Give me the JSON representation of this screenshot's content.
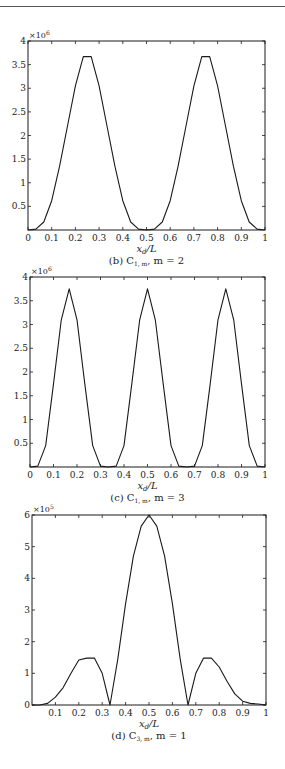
{
  "page": {
    "header_text": "· ·· ·",
    "background": "#ffffff",
    "line_color": "#1a1a1a"
  },
  "chart_data": [
    {
      "id": "b",
      "type": "line",
      "title": "",
      "caption": "(b) C",
      "caption_sub": "1, m",
      "caption_tail": ", m = 2",
      "xlabel": "x_d/L",
      "xlabel_main": "x",
      "xlabel_sub": "d",
      "xlabel_tail": "/L",
      "ylabel": "",
      "y_multiplier": "×10",
      "y_multiplier_exp": "6",
      "xlim": [
        0,
        1
      ],
      "ylim": [
        0,
        4
      ],
      "xticks": [
        0,
        0.1,
        0.2,
        0.3,
        0.4,
        0.5,
        0.6,
        0.7,
        0.8,
        0.9,
        1
      ],
      "xtick_labels": [
        "0",
        "0.1",
        "0.2",
        "0.3",
        "0.4",
        "0.5",
        "0.6",
        "0.7",
        "0.8",
        "0.9",
        "1"
      ],
      "yticks": [
        0.5,
        1,
        1.5,
        2,
        2.5,
        3,
        3.5,
        4
      ],
      "ytick_labels": [
        "0.5",
        "1",
        "1.5",
        "2",
        "2.5",
        "3",
        "3.5",
        "4"
      ],
      "grid": false,
      "legend": null,
      "frame": {
        "top": 41,
        "bottom": 230,
        "left": 28,
        "right": 265
      },
      "x": [
        0,
        0.0333,
        0.0667,
        0.1,
        0.1333,
        0.1667,
        0.2,
        0.2333,
        0.2667,
        0.3,
        0.3333,
        0.3667,
        0.4,
        0.4333,
        0.4667,
        0.5,
        0.5333,
        0.5667,
        0.6,
        0.6333,
        0.6667,
        0.7,
        0.7333,
        0.7667,
        0.8,
        0.8333,
        0.8667,
        0.9,
        0.9333,
        0.9667,
        1
      ],
      "values": [
        0,
        0.02,
        0.17,
        0.62,
        1.35,
        2.2,
        3.05,
        3.67,
        3.67,
        3.05,
        2.2,
        1.35,
        0.62,
        0.17,
        0.02,
        0,
        0.02,
        0.17,
        0.62,
        1.35,
        2.2,
        3.05,
        3.67,
        3.67,
        3.05,
        2.2,
        1.35,
        0.62,
        0.17,
        0.02,
        0
      ]
    },
    {
      "id": "c",
      "type": "line",
      "title": "",
      "caption": "(c) C",
      "caption_sub": "1, m",
      "caption_tail": ", m = 3",
      "xlabel": "x_d/L",
      "xlabel_main": "x",
      "xlabel_sub": "d",
      "xlabel_tail": "/L",
      "ylabel": "",
      "y_multiplier": "×10",
      "y_multiplier_exp": "6",
      "xlim": [
        0,
        1
      ],
      "ylim": [
        0,
        4
      ],
      "xticks": [
        0,
        0.1,
        0.2,
        0.3,
        0.4,
        0.5,
        0.6,
        0.7,
        0.8,
        0.9,
        1
      ],
      "xtick_labels": [
        "0",
        "0.1",
        "0.2",
        "0.3",
        "0.4",
        "0.5",
        "0.6",
        "0.7",
        "0.8",
        "0.9",
        "1"
      ],
      "yticks": [
        0.5,
        1,
        1.5,
        2,
        2.5,
        3,
        3.5,
        4
      ],
      "ytick_labels": [
        "0.5",
        "1",
        "1.5",
        "2",
        "2.5",
        "3",
        "3.5",
        "4"
      ],
      "grid": false,
      "legend": null,
      "frame": {
        "top": 277,
        "bottom": 467,
        "left": 30,
        "right": 265
      },
      "x": [
        0,
        0.0333,
        0.0667,
        0.1,
        0.1333,
        0.1667,
        0.2,
        0.2333,
        0.2667,
        0.3,
        0.3333,
        0.3667,
        0.4,
        0.4333,
        0.4667,
        0.5,
        0.5333,
        0.5667,
        0.6,
        0.6333,
        0.6667,
        0.7,
        0.7333,
        0.7667,
        0.8,
        0.8333,
        0.8667,
        0.9,
        0.9333,
        0.9667,
        1
      ],
      "values": [
        0,
        0.02,
        0.45,
        1.75,
        3.1,
        3.75,
        3.1,
        1.75,
        0.45,
        0.02,
        0,
        0.02,
        0.45,
        1.75,
        3.1,
        3.75,
        3.1,
        1.75,
        0.45,
        0.02,
        0,
        0.02,
        0.45,
        1.75,
        3.1,
        3.75,
        3.1,
        1.75,
        0.45,
        0.02,
        0
      ]
    },
    {
      "id": "d",
      "type": "line",
      "title": "",
      "caption": "(d) C",
      "caption_sub": "3, m",
      "caption_tail": ", m = 1",
      "xlabel": "x_d/L",
      "xlabel_main": "x",
      "xlabel_sub": "d",
      "xlabel_tail": "/L",
      "ylabel": "",
      "y_multiplier": "×10",
      "y_multiplier_exp": "5",
      "xlim": [
        0,
        1
      ],
      "ylim": [
        0,
        6
      ],
      "xticks": [
        0.1,
        0.2,
        0.3,
        0.4,
        0.5,
        0.6,
        0.7,
        0.8,
        0.9,
        1
      ],
      "xtick_labels": [
        "0.1",
        "0.2",
        "0.3",
        "0.4",
        "0.5",
        "0.6",
        "0.7",
        "0.8",
        "0.9",
        "1"
      ],
      "yticks": [
        0,
        1,
        2,
        3,
        4,
        5,
        6
      ],
      "ytick_labels": [
        "0",
        "1",
        "2",
        "3",
        "4",
        "5",
        "6"
      ],
      "grid": false,
      "legend": null,
      "frame": {
        "top": 515,
        "bottom": 705,
        "left": 32,
        "right": 266
      },
      "x": [
        0,
        0.0333,
        0.0667,
        0.1,
        0.1333,
        0.1667,
        0.2,
        0.2333,
        0.2667,
        0.3,
        0.3333,
        0.3667,
        0.4,
        0.4333,
        0.4667,
        0.5,
        0.5333,
        0.5667,
        0.6,
        0.6333,
        0.6667,
        0.7,
        0.7333,
        0.7667,
        0.8,
        0.8333,
        0.8667,
        0.9,
        0.9333,
        0.9667,
        1
      ],
      "values": [
        0,
        0,
        0.05,
        0.25,
        0.55,
        1.0,
        1.42,
        1.48,
        1.48,
        1.0,
        0,
        1.45,
        3.2,
        4.7,
        5.65,
        6.0,
        5.65,
        4.7,
        3.2,
        1.45,
        0,
        1.0,
        1.48,
        1.48,
        1.2,
        0.75,
        0.35,
        0.12,
        0.05,
        0.03,
        0
      ]
    }
  ]
}
